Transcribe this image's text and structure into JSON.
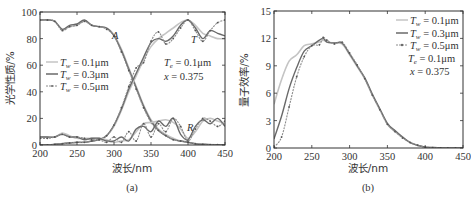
{
  "chart_data": [
    {
      "type": "line",
      "panel": "(a)",
      "title": "",
      "xlabel": "波长/nm",
      "ylabel": "光学性质/%",
      "xlim": [
        200,
        450
      ],
      "ylim": [
        0,
        100
      ],
      "xticks": [
        200,
        250,
        300,
        350,
        400,
        450
      ],
      "yticks": [
        0,
        20,
        40,
        60,
        80,
        100
      ],
      "legend": [
        "T_w = 0.1μm",
        "T_w = 0.3μm",
        "T_w = 0.5μm"
      ],
      "legend_position": "center-left",
      "annotations": [
        "A",
        "T",
        "R",
        "T_e = 0.1μm",
        "x = 0.375"
      ],
      "x": [
        200,
        210,
        220,
        230,
        240,
        250,
        260,
        270,
        280,
        290,
        300,
        310,
        320,
        330,
        340,
        350,
        360,
        370,
        380,
        390,
        400,
        410,
        420,
        430,
        440,
        450
      ],
      "series": [
        {
          "name": "A (T_w=0.1μm)",
          "values": [
            94,
            94,
            93,
            87,
            89,
            90,
            93,
            90,
            89,
            88,
            83,
            72,
            58,
            44,
            30,
            19,
            12,
            8,
            5,
            3,
            2,
            1,
            0.5,
            0.3,
            0.2,
            0.1
          ]
        },
        {
          "name": "A (T_w=0.3μm)",
          "values": [
            94,
            94,
            93,
            87,
            90,
            91,
            94,
            90,
            89,
            88,
            82,
            71,
            57,
            43,
            29,
            18,
            11,
            7,
            4,
            3,
            2,
            1,
            0.5,
            0.3,
            0.2,
            0.1
          ]
        },
        {
          "name": "A (T_w=0.5μm)",
          "values": [
            94,
            94,
            93,
            86,
            89,
            90,
            93,
            90,
            89,
            87,
            82,
            70,
            56,
            42,
            28,
            17,
            11,
            7,
            4,
            3,
            2,
            1,
            0.5,
            0.3,
            0.2,
            0.1
          ]
        },
        {
          "name": "T (T_w=0.1μm)",
          "values": [
            0,
            0,
            0.5,
            1,
            1.5,
            2,
            2,
            3,
            4,
            7,
            14,
            26,
            40,
            52,
            64,
            74,
            80,
            84,
            88,
            92,
            94,
            90,
            84,
            82,
            80,
            80
          ]
        },
        {
          "name": "T (T_w=0.3μm)",
          "values": [
            0,
            0,
            0.5,
            1,
            1.5,
            2,
            2,
            3,
            4,
            7,
            15,
            27,
            42,
            54,
            66,
            77,
            80,
            78,
            82,
            90,
            94,
            88,
            80,
            86,
            84,
            82
          ]
        },
        {
          "name": "T (T_w=0.5μm)",
          "values": [
            0,
            0,
            0.5,
            1,
            1.5,
            2,
            2,
            3,
            4,
            7,
            15,
            28,
            44,
            58,
            62,
            78,
            85,
            76,
            80,
            88,
            94,
            86,
            78,
            86,
            92,
            94
          ]
        },
        {
          "name": "R (T_w=0.1μm)",
          "values": [
            6,
            6,
            6,
            9,
            7,
            5,
            5,
            5,
            5,
            4,
            2,
            3,
            4,
            10,
            16,
            17,
            18,
            19,
            17,
            12,
            5,
            10,
            18,
            20,
            18,
            16
          ]
        },
        {
          "name": "R (T_w=0.3μm)",
          "values": [
            6,
            6,
            6,
            8,
            6,
            6,
            4,
            5,
            5,
            3,
            3,
            6,
            3,
            12,
            14,
            10,
            18,
            14,
            20,
            8,
            4,
            14,
            19,
            16,
            20,
            14
          ]
        },
        {
          "name": "R (T_w=0.5μm)",
          "values": [
            5,
            5,
            6,
            8,
            6,
            6,
            5,
            4,
            4,
            2,
            6,
            2,
            10,
            3,
            16,
            6,
            16,
            10,
            20,
            14,
            3,
            12,
            20,
            18,
            14,
            18
          ]
        }
      ]
    },
    {
      "type": "line",
      "panel": "(b)",
      "title": "",
      "xlabel": "波长/nm",
      "ylabel": "量子效率/%",
      "xlim": [
        200,
        450
      ],
      "ylim": [
        0,
        15
      ],
      "xticks": [
        200,
        250,
        300,
        350,
        400,
        450
      ],
      "yticks": [
        0,
        3,
        6,
        9,
        12,
        15
      ],
      "legend": [
        "T_w = 0.1μm",
        "T_w = 0.3μm",
        "T_w = 0.5μm"
      ],
      "legend_position": "upper-right",
      "annotations": [
        "T_e = 0.1μm",
        "x = 0.375"
      ],
      "x": [
        200,
        210,
        220,
        230,
        240,
        250,
        260,
        265,
        270,
        280,
        290,
        300,
        310,
        320,
        330,
        340,
        350,
        360,
        370,
        380,
        390,
        400,
        410,
        420,
        430,
        440,
        450
      ],
      "series": [
        {
          "name": "T_w = 0.1μm",
          "values": [
            4.8,
            7.5,
            9.5,
            10.2,
            11.2,
            11.4,
            11.6,
            11.8,
            11.6,
            11.5,
            11.4,
            10.2,
            8.9,
            7.6,
            5.8,
            4.2,
            2.6,
            1.8,
            1.2,
            0.6,
            0.3,
            0.1,
            0.05,
            0.02,
            0,
            0,
            0
          ]
        },
        {
          "name": "T_w = 0.3μm",
          "values": [
            1.0,
            3.5,
            6.5,
            8.8,
            10.6,
            11.2,
            11.8,
            12.0,
            11.6,
            11.5,
            11.5,
            10.3,
            9.0,
            7.7,
            5.9,
            4.3,
            2.7,
            1.9,
            1.2,
            0.6,
            0.3,
            0.1,
            0.05,
            0.02,
            0,
            0,
            0
          ]
        },
        {
          "name": "T_w = 0.5μm",
          "values": [
            0.1,
            1.2,
            4.5,
            7.8,
            10.0,
            11.2,
            11.3,
            12.1,
            11.8,
            11.4,
            11.6,
            10.4,
            9.1,
            7.6,
            5.8,
            4.2,
            2.6,
            1.8,
            1.1,
            0.6,
            0.3,
            0.1,
            0.05,
            0.02,
            0,
            0,
            0
          ]
        }
      ]
    }
  ],
  "panel_a": {
    "ylabel": "光学性质/%",
    "xlabel": "波长/nm",
    "caption": "(a)",
    "xticks": [
      "200",
      "250",
      "300",
      "350",
      "400",
      "450"
    ],
    "yticks": [
      "0",
      "20",
      "40",
      "60",
      "80",
      "100"
    ],
    "legend": [
      {
        "sym": "T",
        "sub": "w",
        "val": " = 0.1μm"
      },
      {
        "sym": "T",
        "sub": "w",
        "val": " = 0.3μm"
      },
      {
        "sym": "T",
        "sub": "w",
        "val": " = 0.5μm"
      }
    ],
    "labels": {
      "A": "A",
      "T": "T",
      "R": "R"
    },
    "param1": {
      "sym": "T",
      "sub": "e",
      "val": " = 0.1μm"
    },
    "param2": {
      "sym": "x",
      "val": " = 0.375"
    }
  },
  "panel_b": {
    "ylabel": "量子效率/%",
    "xlabel": "波长/nm",
    "caption": "(b)",
    "xticks": [
      "200",
      "250",
      "300",
      "350",
      "400",
      "450"
    ],
    "yticks": [
      "0",
      "3",
      "6",
      "9",
      "12",
      "15"
    ],
    "legend": [
      {
        "sym": "T",
        "sub": "w",
        "val": " = 0.1μm"
      },
      {
        "sym": "T",
        "sub": "w",
        "val": " = 0.3μm"
      },
      {
        "sym": "T",
        "sub": "w",
        "val": " = 0.5μm"
      }
    ],
    "param1": {
      "sym": "T",
      "sub": "e",
      "val": " = 0.1μm"
    },
    "param2": {
      "sym": "x",
      "val": " = 0.375"
    }
  },
  "colors": {
    "series_0_1": "#c4c4c4",
    "series_0_3": "#6a6a6a",
    "series_0_5": "#8c8c8c",
    "axis": "#333333"
  }
}
